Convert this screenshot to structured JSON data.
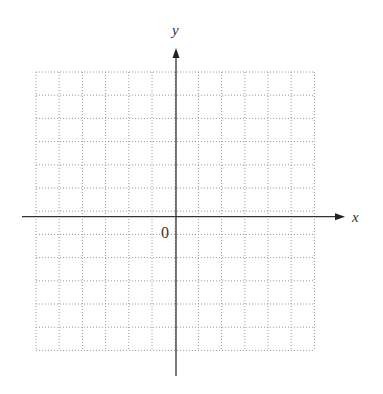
{
  "diagram": {
    "type": "coordinate-grid",
    "x_axis_label": "x",
    "y_axis_label": "y",
    "origin_label": "0",
    "grid": {
      "columns": 12,
      "rows": 12,
      "left": 36,
      "top": 72,
      "cell": 23.2,
      "line_style": "dotted",
      "line_color": "#9a9a9a"
    },
    "axes": {
      "color": "#333333",
      "origin_px": [
        176,
        216.7
      ],
      "x_axis_from": 22,
      "x_axis_to": 345,
      "y_axis_from": 376,
      "y_axis_to": 48
    }
  }
}
